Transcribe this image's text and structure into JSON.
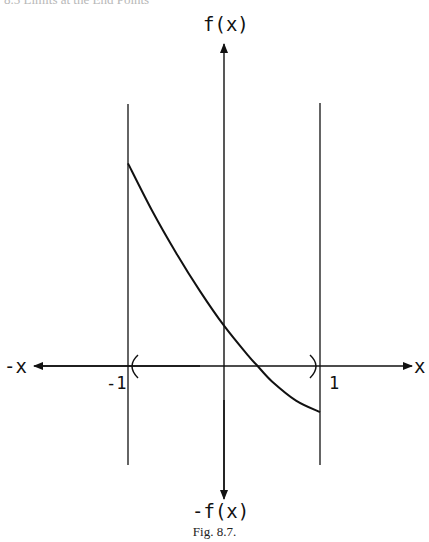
{
  "header": {
    "text": "8.5  Limits at the End Points"
  },
  "figure": {
    "caption": "Fig. 8.7.",
    "labels": {
      "y_pos": "f(x)",
      "y_neg": "-f(x)",
      "x_pos": "x",
      "x_neg": "-x",
      "left_bound": "-1",
      "right_bound": "1"
    },
    "colors": {
      "ink": "#111111"
    }
  },
  "chart_data": {
    "type": "line",
    "title": "",
    "xlabel": "x",
    "ylabel": "f(x)",
    "xlim": [
      -2.1,
      2.0
    ],
    "ylim": [
      -1.4,
      3.4
    ],
    "grid": false,
    "domain_open_interval": [
      -1,
      1
    ],
    "vertical_lines_at_x": [
      -1,
      1
    ],
    "tick_labels": {
      "x": [
        "-1",
        "1"
      ]
    },
    "series": [
      {
        "name": "f(x)",
        "x": [
          -1.0,
          -0.75,
          -0.5,
          -0.25,
          0.0,
          0.25,
          0.35,
          0.5,
          0.75,
          1.0
        ],
        "y": [
          2.11,
          1.62,
          1.18,
          0.78,
          0.42,
          0.11,
          0.0,
          -0.16,
          -0.36,
          -0.48
        ]
      }
    ]
  }
}
